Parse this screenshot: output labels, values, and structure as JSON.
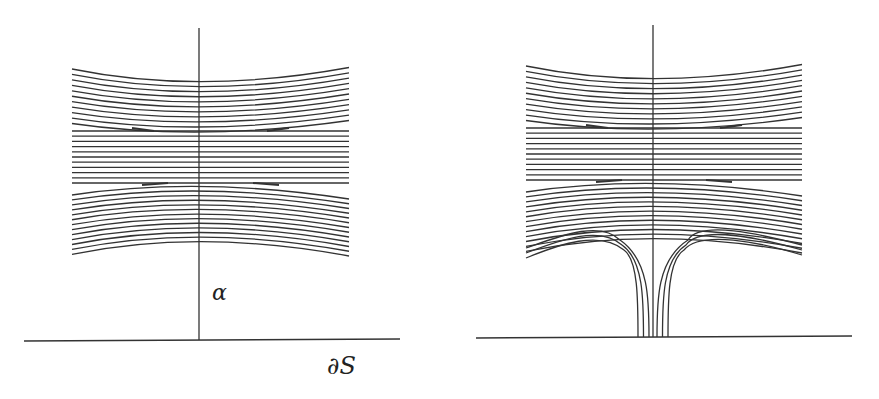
{
  "figure": {
    "panels": [
      {
        "id": "left",
        "description": "Foliation bands crossing arc alpha; arc meets boundary",
        "arc_label": "α",
        "boundary_label": "∂S",
        "band_counts": {
          "top": 11,
          "middle": 11,
          "bottom": 13
        },
        "geometry": {
          "x_left": 72,
          "x_right": 349,
          "arc_x": 199,
          "arc_top": 28,
          "boundary_y": 340,
          "boundary_x1": 24,
          "boundary_x2": 400
        }
      },
      {
        "id": "right",
        "description": "Same foliation with leaves pulled down to boundary along alpha (spike)",
        "band_counts": {
          "top": 11,
          "middle": 11,
          "bottom": 13,
          "spike_leaves_each_side": 3
        },
        "geometry": {
          "x_left": 526,
          "x_right": 802,
          "arc_x": 653,
          "arc_top": 25,
          "boundary_y": 337,
          "boundary_x1": 476,
          "boundary_x2": 852
        }
      }
    ],
    "stroke_color": "#333333"
  }
}
